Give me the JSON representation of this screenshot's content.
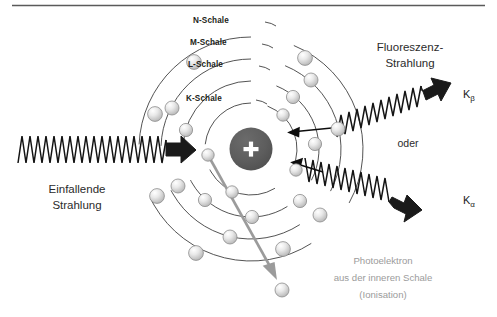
{
  "figure": {
    "type": "physics-diagram",
    "language": "de",
    "top_rule": true
  },
  "nucleus": {
    "symbol": "+",
    "color": "#595959",
    "label": "nucleus"
  },
  "shells": [
    {
      "id": "K",
      "label": "K-Schale",
      "radius": 46,
      "electrons": 4
    },
    {
      "id": "L",
      "label": "L-Schale",
      "radius": 68,
      "electrons": 6
    },
    {
      "id": "M",
      "label": "M-Schale",
      "radius": 90,
      "electrons": 6
    },
    {
      "id": "N",
      "label": "N-Schale",
      "radius": 112,
      "electrons": 6
    }
  ],
  "labels": {
    "incoming": "Einfallende\nStrahlung",
    "incoming_line1": "Einfallende",
    "incoming_line2": "Strahlung",
    "fluorescence_line1": "Fluoreszenz-",
    "fluorescence_line2": "Strahlung",
    "or": "oder",
    "k_beta": "K",
    "k_beta_sub": "β",
    "k_alpha": "K",
    "k_alpha_sub": "α",
    "photoelectron_line1": "Photoelektron",
    "photoelectron_line2": "aus der inneren Schale",
    "photoelectron_line3": "(Ionisation)"
  },
  "colors": {
    "ink": "#231f20",
    "nucleus_fill": "#595959",
    "electron_light": "#f2f2f2",
    "electron_dark": "#b9b9b9",
    "electron_stroke": "#8d8d8d",
    "shell_stroke": "#3f3f3f",
    "gray_text": "#9b9b9b",
    "photoelectron_arrow": "#9b9b9b",
    "wave": "#141414",
    "arrow_black": "#1a1a1a",
    "rule": "#5a5a5a",
    "background": "#ffffff"
  },
  "arrows": {
    "incoming_ray": {
      "name": "einfallende-strahlung-wave",
      "direction": "left-to-right",
      "head": "black-block-arrow"
    },
    "k_beta_ray": {
      "name": "k-beta-fluorescence-wave",
      "direction": "up-right",
      "head": "black-block-arrow"
    },
    "k_alpha_ray": {
      "name": "k-alpha-fluorescence-wave",
      "direction": "right",
      "head": "black-block-arrow"
    },
    "transition_upper": {
      "name": "electron-transition-arrow-upper",
      "from_shell": "M",
      "to_shell": "K"
    },
    "transition_lower": {
      "name": "electron-transition-arrow-lower",
      "from_shell": "L",
      "to_shell": "K"
    },
    "photoelectron": {
      "name": "photoelectron-ejection-arrow",
      "from_shell": "K",
      "direction": "down-right"
    }
  }
}
